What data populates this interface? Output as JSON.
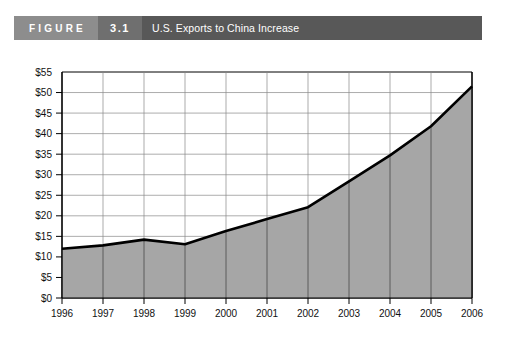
{
  "header": {
    "figure_word": "FIGURE",
    "figure_number": "3.1",
    "title": "U.S. Exports to China Increase"
  },
  "colors": {
    "figure_word_bg": "#8d8d8d",
    "figure_number_bg": "#6f6f6f",
    "title_bar_bg": "#585858",
    "area_fill": "#a6a6a6",
    "line_stroke": "#000000",
    "gridline": "#888888",
    "axis": "#000000",
    "text": "#111111"
  },
  "chart_data": {
    "type": "area",
    "title": "U.S. Exports to China Increase",
    "xlabel": "",
    "ylabel": "",
    "categories": [
      "1996",
      "1997",
      "1998",
      "1999",
      "2000",
      "2001",
      "2002",
      "2003",
      "2004",
      "2005",
      "2006"
    ],
    "values": [
      12.0,
      12.8,
      14.2,
      13.1,
      16.3,
      19.2,
      22.1,
      28.4,
      34.7,
      41.8,
      51.5
    ],
    "ylim": [
      0,
      55
    ],
    "ytick_values": [
      0,
      5,
      10,
      15,
      20,
      25,
      30,
      35,
      40,
      45,
      50,
      55
    ],
    "ytick_labels": [
      "$0",
      "$5",
      "$10",
      "$15",
      "$20",
      "$25",
      "$30",
      "$35",
      "$40",
      "$45",
      "$50",
      "$55"
    ],
    "grid": true,
    "grid_axis": "both",
    "legend": false,
    "legend_position": "none",
    "series": [
      {
        "name": "U.S. Exports to China",
        "values": [
          12.0,
          12.8,
          14.2,
          13.1,
          16.3,
          19.2,
          22.1,
          28.4,
          34.7,
          41.8,
          51.5
        ]
      }
    ]
  }
}
